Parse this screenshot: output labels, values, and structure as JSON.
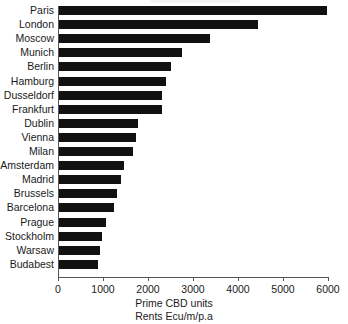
{
  "chart_data": {
    "type": "bar",
    "orientation": "horizontal",
    "title": "",
    "xlabel": "Prime CBD units",
    "xlabel_line2": "Rents Ecu/m/p.a",
    "ylabel": "",
    "categories": [
      "Paris",
      "London",
      "Moscow",
      "Munich",
      "Berlin",
      "Hamburg",
      "Dusseldorf",
      "Frankfurt",
      "Dublin",
      "Vienna",
      "Milan",
      "Amsterdam",
      "Madrid",
      "Brussels",
      "Barcelona",
      "Prague",
      "Stockholm",
      "Warsaw",
      "Budabest"
    ],
    "values": [
      5970,
      4450,
      3370,
      2760,
      2500,
      2390,
      2320,
      2300,
      1780,
      1730,
      1670,
      1470,
      1410,
      1320,
      1250,
      1060,
      970,
      940,
      880
    ],
    "xlim": [
      0,
      6000
    ],
    "xticks": [
      0,
      1000,
      2000,
      3000,
      4000,
      5000,
      6000
    ],
    "xtick_labels": [
      "0",
      "1000",
      "2000",
      "3000",
      "4000",
      "5000",
      "6000"
    ],
    "grid": false,
    "legend": null,
    "bar_color": "#111111",
    "axis_color": "#555555",
    "background_color": "#ffffff"
  },
  "captions": {
    "line1": "Prime CBD units",
    "line2": "Rents Ecu/m/p.a"
  }
}
